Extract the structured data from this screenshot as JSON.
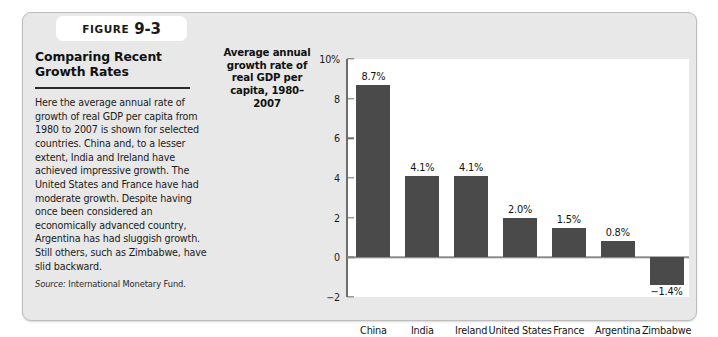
{
  "figure": {
    "tab_word": "Figure",
    "tab_number": "9-3",
    "title": "Comparing Recent Growth Rates",
    "body": "Here the average annual rate of growth of real GDP per capita from 1980 to 2007 is shown for selected countries. China and, to a lesser extent, India and Ireland have achieved impressive growth. The United States and France have had moderate growth. Despite having once been considered an economically advanced country, Argentina has had sluggish growth. Still others, such as Zimbabwe, have slid backward.",
    "source_label": "Source:",
    "source_text": "International Monetary Fund."
  },
  "chart_data": {
    "type": "bar",
    "title": "",
    "ylabel": "Average annual growth rate of real GDP per capita, 1980–2007",
    "xlabel": "",
    "categories": [
      "China",
      "India",
      "Ireland",
      "United States",
      "France",
      "Argentina",
      "Zimbabwe"
    ],
    "values": [
      8.7,
      4.1,
      4.1,
      2.0,
      1.5,
      0.8,
      -1.4
    ],
    "value_labels": [
      "8.7%",
      "4.1%",
      "4.1%",
      "2.0%",
      "1.5%",
      "0.8%",
      "−1.4%"
    ],
    "ylim": [
      -2,
      10
    ],
    "yticks": [
      10,
      8,
      6,
      4,
      2,
      0,
      -2
    ],
    "ytick_labels": [
      "10%",
      "8",
      "6",
      "4",
      "2",
      "0",
      "−2"
    ],
    "grid": false,
    "legend": false,
    "bar_color": "#4a4a4a",
    "plot_background": "#ffffff",
    "panel_background": "#e8e8e8"
  }
}
